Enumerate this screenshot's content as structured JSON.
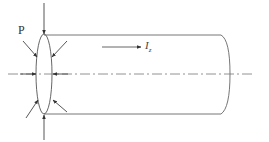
{
  "figure": {
    "labels": {
      "force": "P",
      "current_main": "I",
      "current_sub": "z"
    },
    "colors": {
      "stroke": "#555555",
      "centerline": "#666666",
      "background": "#ffffff"
    },
    "geometry": {
      "centerline_y": 74,
      "cylinder_top_y": 35,
      "cylinder_bottom_y": 114,
      "left_ellipse_cx": 44,
      "left_ellipse_rx": 8,
      "right_end_x": 230
    },
    "arrows": [
      {
        "name": "top-vertical",
        "direction": "down"
      },
      {
        "name": "bottom-vertical",
        "direction": "up"
      },
      {
        "name": "upper-left-diagonal",
        "direction": "inward"
      },
      {
        "name": "upper-right-diagonal",
        "direction": "inward"
      },
      {
        "name": "lower-left-diagonal",
        "direction": "inward"
      },
      {
        "name": "lower-right-diagonal",
        "direction": "inward"
      },
      {
        "name": "left-horizontal",
        "direction": "right"
      },
      {
        "name": "right-horizontal",
        "direction": "left"
      },
      {
        "name": "current-arrow",
        "direction": "right"
      }
    ]
  }
}
